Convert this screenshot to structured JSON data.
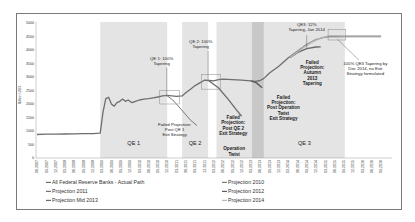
{
  "chart_data": {
    "type": "line",
    "title": "",
    "ylabel": "Billion USD",
    "xlabel": "",
    "ylim": [
      0,
      5000
    ],
    "yticks": [
      0,
      500,
      1000,
      1500,
      2000,
      2500,
      3000,
      3500,
      4000,
      4500,
      5000
    ],
    "grid": false,
    "legend_position": "bottom",
    "x_tick_labels": [
      "06.2007",
      "09.2007",
      "12.2007",
      "03.2008",
      "06.2008",
      "09.2008",
      "12.2008",
      "03.2009",
      "06.2009",
      "09.2009",
      "12.2009",
      "03.2010",
      "06.2010",
      "09.2010",
      "12.2010",
      "03.2011",
      "06.2011",
      "09.2011",
      "12.2011",
      "03.2012",
      "06.2012",
      "09.2012",
      "12.2012",
      "03.2013",
      "06.2013",
      "09.2013",
      "12.2013",
      "03.2014",
      "06.2014",
      "09.2014",
      "12.2014",
      "03.2015",
      "06.2015",
      "09.2015",
      "12.2015",
      "03.2016",
      "06.2016",
      "09.2016"
    ],
    "regions": [
      {
        "label": "QE 1",
        "x0": 6.8,
        "x1": 14.0,
        "shade": "#e4e4e4"
      },
      {
        "label": "QE 2",
        "x0": 15.6,
        "x1": 18.4,
        "shade": "#e4e4e4"
      },
      {
        "label": "Operation Twist",
        "x0": 19.3,
        "x1": 23.1,
        "shade": "#e4e4e4"
      },
      {
        "label": "",
        "x0": 23.1,
        "x1": 24.4,
        "shade": "#c8c8c8"
      },
      {
        "label": "QE 3",
        "x0": 24.4,
        "x1": 33.1,
        "shade": "#e4e4e4"
      }
    ],
    "series": [
      {
        "name": "All Federal Reserve Banks - Actual Path",
        "color": "#6e6e6e",
        "width": 1.3,
        "points": [
          [
            0,
            870
          ],
          [
            1,
            880
          ],
          [
            2,
            885
          ],
          [
            3,
            890
          ],
          [
            4,
            895
          ],
          [
            5,
            900
          ],
          [
            6,
            905
          ],
          [
            6.8,
            920
          ],
          [
            7.1,
            1700
          ],
          [
            7.4,
            2200
          ],
          [
            7.7,
            2250
          ],
          [
            8.0,
            2000
          ],
          [
            8.3,
            1920
          ],
          [
            8.6,
            2050
          ],
          [
            8.9,
            2100
          ],
          [
            9.2,
            2180
          ],
          [
            9.5,
            2100
          ],
          [
            9.8,
            2150
          ],
          [
            10.2,
            2050
          ],
          [
            10.6,
            2100
          ],
          [
            11,
            2150
          ],
          [
            11.5,
            2180
          ],
          [
            12,
            2200
          ],
          [
            12.5,
            2230
          ],
          [
            13,
            2260
          ],
          [
            13.5,
            2300
          ],
          [
            14,
            2320
          ],
          [
            14.5,
            2300
          ],
          [
            15,
            2280
          ],
          [
            15.6,
            2300
          ],
          [
            16,
            2420
          ],
          [
            16.5,
            2550
          ],
          [
            17,
            2680
          ],
          [
            17.5,
            2780
          ],
          [
            18,
            2880
          ],
          [
            18.5,
            2870
          ],
          [
            19,
            2860
          ],
          [
            19.5,
            2900
          ],
          [
            20,
            2920
          ],
          [
            21,
            2900
          ],
          [
            22,
            2880
          ],
          [
            23,
            2860
          ],
          [
            23.5,
            2840
          ],
          [
            24,
            2870
          ],
          [
            24.4,
            2950
          ],
          [
            25,
            3150
          ],
          [
            26,
            3400
          ],
          [
            27,
            3700
          ],
          [
            28,
            3950
          ],
          [
            29,
            4200
          ],
          [
            30,
            4380
          ],
          [
            31,
            4480
          ],
          [
            31.5,
            4500
          ],
          [
            32,
            4500
          ],
          [
            33,
            4500
          ],
          [
            34,
            4500
          ],
          [
            35,
            4500
          ],
          [
            36,
            4500
          ],
          [
            37,
            4500
          ]
        ]
      },
      {
        "name": "Projection 2010",
        "color": "#7a7a7a",
        "width": 1.0,
        "points": [
          [
            13.9,
            2330
          ],
          [
            14.6,
            2150
          ],
          [
            15.5,
            1800
          ],
          [
            16.5,
            1400
          ],
          [
            17.2,
            1200
          ]
        ]
      },
      {
        "name": "Projection 2011",
        "color": "#707070",
        "width": 1.4,
        "points": [
          [
            18.4,
            2880
          ],
          [
            19.5,
            2600
          ],
          [
            20.5,
            2200
          ],
          [
            21.4,
            1800
          ],
          [
            22.0,
            1550
          ]
        ]
      },
      {
        "name": "Projection 2012",
        "color": "#5e5e5e",
        "width": 1.4,
        "points": [
          [
            23.0,
            2860
          ],
          [
            23.6,
            2780
          ],
          [
            24.2,
            2600
          ]
        ]
      },
      {
        "name": "Projection Mid 2013",
        "color": "#6a6a6a",
        "width": 1.3,
        "points": [
          [
            27.2,
            3720
          ],
          [
            28,
            3900
          ],
          [
            29,
            4050
          ],
          [
            30,
            4110
          ],
          [
            30.5,
            4120
          ]
        ]
      },
      {
        "name": "Projection 2014",
        "color": "#b9b9b9",
        "width": 1.3,
        "points": [
          [
            27.2,
            3720
          ],
          [
            28.5,
            4060
          ],
          [
            29.5,
            4280
          ],
          [
            30.5,
            4450
          ],
          [
            31.5,
            4530
          ],
          [
            33,
            4520
          ],
          [
            35,
            4520
          ],
          [
            37,
            4520
          ]
        ]
      }
    ],
    "annotations": [
      {
        "lines": [
          "QE 1: 100%",
          "Tapering"
        ],
        "x": 13.4,
        "y": 3620,
        "bold": false,
        "leader": [
          [
            13.95,
            3350
          ],
          [
            13.95,
            2350
          ]
        ]
      },
      {
        "lines": [
          "Failed Projection:",
          "Post QE 1",
          "Exit Strategy"
        ],
        "x": 14.8,
        "y": 1200,
        "bold": false,
        "leader": null
      },
      {
        "lines": [
          "QE 2: 100%",
          "Tapering"
        ],
        "x": 17.6,
        "y": 4250,
        "bold": false,
        "leader": [
          [
            18.4,
            3970
          ],
          [
            18.4,
            2900
          ]
        ]
      },
      {
        "lines": [
          "Failed",
          "Projection:",
          "Post QE 2",
          "Exit Strategy"
        ],
        "x": 21.1,
        "y": 1450,
        "bold": true,
        "leader": null
      },
      {
        "lines": [
          "Operation",
          "Twist"
        ],
        "x": 21.2,
        "y": 280,
        "bold": true,
        "leader": null
      },
      {
        "lines": [
          "Failed",
          "Projection:",
          "Post Operation",
          "Twist",
          "Exit Strategy"
        ],
        "x": 26.5,
        "y": 2200,
        "bold": true,
        "leader": null
      },
      {
        "lines": [
          "QE3: 12%",
          "Tapering, Jan 2014"
        ],
        "x": 29.0,
        "y": 4900,
        "bold": false,
        "leader": [
          [
            29.0,
            4550
          ],
          [
            29.0,
            4060
          ]
        ]
      },
      {
        "lines": [
          "Failed",
          "Projection:",
          "Autumn",
          "2013",
          "Tapering"
        ],
        "x": 29.6,
        "y": 3500,
        "bold": true,
        "leader": null
      },
      {
        "lines": [
          "100% QE3 Tapering by",
          "Dec 2014, no Exit",
          "Strategy formulated"
        ],
        "x": 35.3,
        "y": 3450,
        "bold": false,
        "leader": [
          [
            32.3,
            4400
          ],
          [
            34.6,
            3630
          ]
        ]
      }
    ],
    "highlight_boxes": [
      {
        "x0": 13.2,
        "x1": 15.3,
        "y0": 2000,
        "y1": 2500
      },
      {
        "x0": 17.7,
        "x1": 19.7,
        "y0": 2550,
        "y1": 3100
      },
      {
        "x0": 31.3,
        "x1": 33.2,
        "y0": 4370,
        "y1": 4760
      }
    ],
    "legend": [
      {
        "label": "All Federal Reserve Banks - Actual Path",
        "color": "#6e6e6e"
      },
      {
        "label": "Projection 2010",
        "color": "#7a7a7a"
      },
      {
        "label": "Projection 2011",
        "color": "#707070"
      },
      {
        "label": "Projection 2012",
        "color": "#5e5e5e"
      },
      {
        "label": "Projection Mid 2013",
        "color": "#6a6a6a"
      },
      {
        "label": "Projection 2014",
        "color": "#b9b9b9"
      }
    ]
  }
}
